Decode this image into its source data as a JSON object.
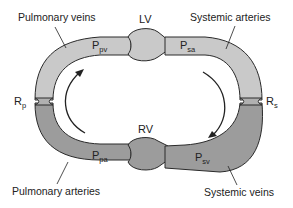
{
  "diagram": {
    "type": "circulation-loop",
    "colors": {
      "arterial_fill": "#c9c9c9",
      "venous_fill": "#9c9c9c",
      "outline": "#2a2a2a",
      "background": "#ffffff"
    },
    "chambers": {
      "lv": "LV",
      "rv": "RV"
    },
    "resistances": {
      "pulmonary": {
        "main": "R",
        "sub": "p"
      },
      "systemic": {
        "main": "R",
        "sub": "s"
      }
    },
    "pressures": {
      "pv": {
        "main": "P",
        "sub": "pv"
      },
      "sa": {
        "main": "P",
        "sub": "sa"
      },
      "pa": {
        "main": "P",
        "sub": "pa"
      },
      "sv": {
        "main": "P",
        "sub": "sv"
      }
    },
    "vessel_labels": {
      "pulmonary_veins": "Pulmonary veins",
      "systemic_arteries": "Systemic arteries",
      "pulmonary_arteries": "Pulmonary arteries",
      "systemic_veins": "Systemic veins"
    },
    "flow_direction": "clockwise"
  }
}
